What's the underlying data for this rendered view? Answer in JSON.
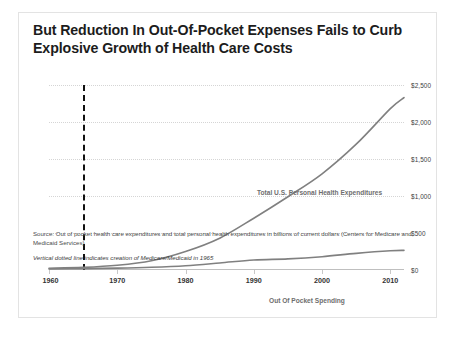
{
  "slide": {
    "title_line1": "But Reduction In Out-Of-Pocket Expenses Fails to Curb",
    "title_line2": "Explosive Growth of Health Care Costs",
    "source_note": "Source: Out of pocket health care expenditures and total personal health expenditures in billions of current dollars (Centers for Medicare and Medicaid Services)",
    "footnote": "Vertical dotted line indicates creation of Medicare/Medicaid in 1965"
  },
  "colors": {
    "line": "#808080",
    "gridline": "#d5d5d5",
    "vertical_marker": "#111111",
    "title_text": "#1c1c1c",
    "label_text": "#6e6e6e"
  },
  "chart_data": {
    "type": "line",
    "title": "But Reduction In Out-Of-Pocket Expenses Fails to Curb Explosive Growth of Health Care Costs",
    "xlabel": "",
    "ylabel": "",
    "xlim": [
      1960,
      2012
    ],
    "ylim": [
      0,
      2500
    ],
    "grid": true,
    "legend": "inline-labels",
    "x_ticks": [
      1960,
      1970,
      1980,
      1990,
      2000,
      2010
    ],
    "x_tick_labels": [
      "1960",
      "1970",
      "1980",
      "1990",
      "2000",
      "2010"
    ],
    "y_ticks": [
      0,
      500,
      1000,
      1500,
      2000,
      2500
    ],
    "y_tick_labels": [
      "$0",
      "$500",
      "$1,000",
      "$1,500",
      "$2,000",
      "$2,500"
    ],
    "x": [
      1960,
      1965,
      1970,
      1975,
      1980,
      1985,
      1990,
      1995,
      2000,
      2005,
      2010,
      2012
    ],
    "series": [
      {
        "name": "Total U.S. Personal Health Expenditures",
        "values": [
          23,
          35,
          64,
          125,
          250,
          430,
          700,
          990,
          1300,
          1700,
          2180,
          2330
        ]
      },
      {
        "name": "Out Of Pocket Spending",
        "values": [
          13,
          18,
          25,
          37,
          58,
          95,
          135,
          150,
          180,
          225,
          260,
          265
        ]
      }
    ],
    "annotations": [
      {
        "name": "medicare-medicaid-marker",
        "type": "vertical-dashed-line",
        "x": 1965,
        "note": "Vertical dotted line indicates creation of Medicare/Medicaid in 1965"
      },
      {
        "name": "total-series-label",
        "text": "Total U.S. Personal Health Expenditures"
      },
      {
        "name": "oop-series-label",
        "text": "Out Of Pocket Spending"
      }
    ]
  }
}
